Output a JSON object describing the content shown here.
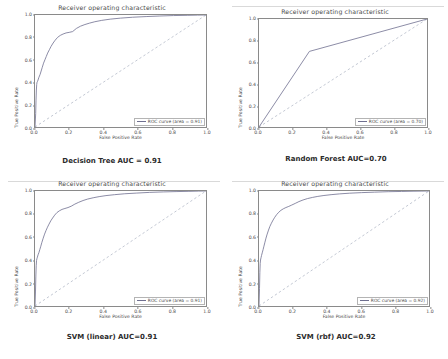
{
  "figure": {
    "panels": [
      {
        "id": "decision-tree",
        "title": "Receiver operating characteristic",
        "xlabel": "False Positive Rate",
        "ylabel": "True Positive Rate",
        "legend_label": "ROC curve (area = 0.91)",
        "caption": "Decision Tree AUC = 0.91"
      },
      {
        "id": "random-forest",
        "title": "Receiver operating characteristic",
        "xlabel": "False Positive Rate",
        "ylabel": "True Positive Rate",
        "legend_label": "ROC curve (area = 0.70)",
        "caption": "Random Forest AUC=0.70"
      },
      {
        "id": "svm-linear",
        "title": "Receiver operating characteristic",
        "xlabel": "False Positive Rate",
        "ylabel": "True Positive Rate",
        "legend_label": "ROC curve (area = 0.91)",
        "caption": "SVM (linear) AUC=0.91"
      },
      {
        "id": "svm-rbf",
        "title": "Receiver operating characteristic",
        "xlabel": "False Positive Rate",
        "ylabel": "True Positive Rate",
        "legend_label": "ROC curve (area = 0.92)",
        "caption": "SVM (rbf) AUC=0.92"
      }
    ],
    "ticks": {
      "x": [
        "0.0",
        "0.2",
        "0.4",
        "0.6",
        "0.8",
        "1.0"
      ],
      "y": [
        "0.0",
        "0.2",
        "0.4",
        "0.6",
        "0.8",
        "1.0"
      ]
    },
    "colors": {
      "curve": "#6f6f8f",
      "chance": "#9aa3b5",
      "axis": "#8a8a8a",
      "text": "#4a4a4a",
      "background": "#ffffff"
    }
  },
  "chart_data": [
    {
      "type": "line",
      "id": "decision-tree",
      "title": "Receiver operating characteristic",
      "xlabel": "False Positive Rate",
      "ylabel": "True Positive Rate",
      "xlim": [
        0,
        1
      ],
      "ylim": [
        0,
        1
      ],
      "grid": false,
      "legend_position": "lower right",
      "annotations": [
        "Decision Tree AUC = 0.91"
      ],
      "series": [
        {
          "name": "ROC curve (area = 0.91)",
          "auc": 0.91,
          "style": "solid",
          "x": [
            0.0,
            0.004,
            0.006,
            0.008,
            0.01,
            0.012,
            0.014,
            0.018,
            0.022,
            0.026,
            0.03,
            0.036,
            0.042,
            0.05,
            0.058,
            0.066,
            0.074,
            0.084,
            0.094,
            0.106,
            0.118,
            0.132,
            0.148,
            0.164,
            0.182,
            0.2,
            0.22,
            0.242,
            0.266,
            0.292,
            0.32,
            0.35,
            0.39,
            0.44,
            0.5,
            0.57,
            0.65,
            0.73,
            0.81,
            0.89,
            0.95,
            1.0
          ],
          "y": [
            0.0,
            0.12,
            0.24,
            0.33,
            0.38,
            0.4,
            0.405,
            0.42,
            0.44,
            0.455,
            0.47,
            0.5,
            0.53,
            0.57,
            0.6,
            0.63,
            0.66,
            0.69,
            0.72,
            0.75,
            0.775,
            0.8,
            0.818,
            0.83,
            0.84,
            0.845,
            0.852,
            0.88,
            0.9,
            0.915,
            0.928,
            0.94,
            0.952,
            0.963,
            0.972,
            0.98,
            0.986,
            0.991,
            0.995,
            0.997,
            0.999,
            1.0
          ]
        },
        {
          "name": "chance",
          "style": "dashed",
          "x": [
            0,
            1
          ],
          "y": [
            0,
            1
          ]
        }
      ]
    },
    {
      "type": "line",
      "id": "random-forest",
      "title": "Receiver operating characteristic",
      "xlabel": "False Positive Rate",
      "ylabel": "True Positive Rate",
      "xlim": [
        0,
        1
      ],
      "ylim": [
        0,
        1
      ],
      "grid": false,
      "legend_position": "lower right",
      "annotations": [
        "Random Forest AUC=0.70"
      ],
      "series": [
        {
          "name": "ROC curve (area = 0.70)",
          "auc": 0.7,
          "style": "solid",
          "x": [
            0.0,
            0.3,
            1.0
          ],
          "y": [
            0.0,
            0.7,
            1.0
          ]
        },
        {
          "name": "chance",
          "style": "dashed",
          "x": [
            0,
            1
          ],
          "y": [
            0,
            1
          ]
        }
      ]
    },
    {
      "type": "line",
      "id": "svm-linear",
      "title": "Receiver operating characteristic",
      "xlabel": "False Positive Rate",
      "ylabel": "True Positive Rate",
      "xlim": [
        0,
        1
      ],
      "ylim": [
        0,
        1
      ],
      "grid": false,
      "legend_position": "lower right",
      "annotations": [
        "SVM (linear) AUC=0.91"
      ],
      "series": [
        {
          "name": "ROC curve (area = 0.91)",
          "auc": 0.91,
          "style": "solid",
          "x": [
            0.0,
            0.003,
            0.005,
            0.007,
            0.009,
            0.011,
            0.014,
            0.018,
            0.023,
            0.028,
            0.034,
            0.04,
            0.048,
            0.056,
            0.064,
            0.073,
            0.082,
            0.092,
            0.103,
            0.115,
            0.128,
            0.143,
            0.158,
            0.175,
            0.193,
            0.212,
            0.233,
            0.256,
            0.281,
            0.308,
            0.34,
            0.375,
            0.415,
            0.465,
            0.525,
            0.595,
            0.67,
            0.75,
            0.83,
            0.9,
            0.955,
            1.0
          ],
          "y": [
            0.0,
            0.13,
            0.26,
            0.35,
            0.395,
            0.41,
            0.425,
            0.445,
            0.465,
            0.49,
            0.52,
            0.552,
            0.59,
            0.625,
            0.655,
            0.685,
            0.712,
            0.74,
            0.765,
            0.79,
            0.812,
            0.828,
            0.84,
            0.848,
            0.856,
            0.868,
            0.886,
            0.902,
            0.917,
            0.93,
            0.941,
            0.951,
            0.96,
            0.968,
            0.976,
            0.982,
            0.988,
            0.992,
            0.995,
            0.997,
            0.999,
            1.0
          ]
        },
        {
          "name": "chance",
          "style": "dashed",
          "x": [
            0,
            1
          ],
          "y": [
            0,
            1
          ]
        }
      ]
    },
    {
      "type": "line",
      "id": "svm-rbf",
      "title": "Receiver operating characteristic",
      "xlabel": "False Positive Rate",
      "ylabel": "True Positive Rate",
      "xlim": [
        0,
        1
      ],
      "ylim": [
        0,
        1
      ],
      "grid": false,
      "legend_position": "lower right",
      "annotations": [
        "SVM (rbf) AUC=0.92"
      ],
      "series": [
        {
          "name": "ROC curve (area = 0.92)",
          "auc": 0.92,
          "style": "solid",
          "x": [
            0.0,
            0.003,
            0.005,
            0.007,
            0.009,
            0.012,
            0.015,
            0.019,
            0.024,
            0.029,
            0.035,
            0.041,
            0.048,
            0.056,
            0.064,
            0.073,
            0.083,
            0.093,
            0.104,
            0.116,
            0.129,
            0.143,
            0.158,
            0.175,
            0.193,
            0.213,
            0.235,
            0.259,
            0.285,
            0.314,
            0.346,
            0.382,
            0.424,
            0.474,
            0.534,
            0.604,
            0.68,
            0.76,
            0.838,
            0.906,
            0.958,
            1.0
          ],
          "y": [
            0.0,
            0.15,
            0.29,
            0.37,
            0.4,
            0.42,
            0.44,
            0.462,
            0.49,
            0.52,
            0.555,
            0.59,
            0.625,
            0.66,
            0.692,
            0.72,
            0.748,
            0.772,
            0.795,
            0.815,
            0.832,
            0.845,
            0.856,
            0.866,
            0.878,
            0.892,
            0.908,
            0.922,
            0.934,
            0.944,
            0.953,
            0.961,
            0.968,
            0.975,
            0.981,
            0.986,
            0.99,
            0.994,
            0.996,
            0.998,
            0.999,
            1.0
          ]
        },
        {
          "name": "chance",
          "style": "dashed",
          "x": [
            0,
            1
          ],
          "y": [
            0,
            1
          ]
        }
      ]
    }
  ]
}
